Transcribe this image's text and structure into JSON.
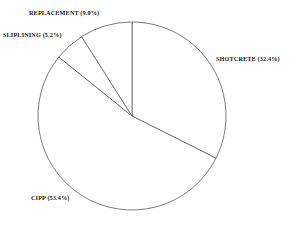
{
  "chart_data": {
    "type": "pie",
    "title": "",
    "subtitle": "",
    "xlabel": "",
    "ylabel": "",
    "legend_position": "none",
    "grid": false,
    "start_angle_deg": 90,
    "direction": "clockwise",
    "categories": [
      "SHOTCRETE",
      "CIPP",
      "SLIPLINING",
      "REPLACEMENT"
    ],
    "values": [
      32.4,
      53.4,
      5.2,
      9.0
    ],
    "value_unit": "%",
    "slice_fill": "#ffffff",
    "slice_stroke": "#6d6d6d",
    "slices": [
      {
        "name": "SHOTCRETE",
        "value": 32.4,
        "label": "SHOTCRETE (32.4%)",
        "start_deg": 0.0,
        "end_deg": 116.64,
        "label_position": "right"
      },
      {
        "name": "CIPP",
        "value": 53.4,
        "label": "CIPP (53.4%)",
        "start_deg": 116.64,
        "end_deg": 308.88,
        "label_position": "bottom-left"
      },
      {
        "name": "SLIPLINING",
        "value": 5.2,
        "label": "SLIPLINING (5.2%)",
        "start_deg": 308.88,
        "end_deg": 327.6,
        "label_position": "top-left"
      },
      {
        "name": "REPLACEMENT",
        "value": 9.0,
        "label": "REPLACEMENT (9.0%)",
        "start_deg": 327.6,
        "end_deg": 360.0,
        "label_position": "top"
      }
    ],
    "geometry": {
      "center_x": 132,
      "center_y": 116,
      "radius": 94
    }
  }
}
